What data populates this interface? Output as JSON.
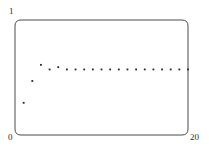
{
  "chart_data": {
    "type": "scatter",
    "title": "",
    "subtitle": "",
    "xlabel": "",
    "ylabel": "",
    "xlim": [
      0,
      20
    ],
    "ylim": [
      0,
      1
    ],
    "grid": false,
    "legend": null,
    "x_tick_labels": [
      "0",
      "20"
    ],
    "y_tick_labels": [
      "0",
      "1"
    ],
    "marker": "square-dot",
    "marker_color": "#262626",
    "frame_color": "#4a4a4a",
    "x": [
      1,
      2,
      3,
      4,
      5,
      6,
      7,
      8,
      9,
      10,
      11,
      12,
      13,
      14,
      15,
      16,
      17,
      18,
      19,
      20
    ],
    "values": [
      0.28,
      0.47,
      0.61,
      0.57,
      0.59,
      0.57,
      0.57,
      0.57,
      0.57,
      0.57,
      0.57,
      0.57,
      0.57,
      0.57,
      0.57,
      0.57,
      0.57,
      0.57,
      0.57,
      0.57
    ],
    "series": [
      {
        "name": "series-1",
        "values": [
          0.28,
          0.47,
          0.61,
          0.57,
          0.59,
          0.57,
          0.57,
          0.57,
          0.57,
          0.57,
          0.57,
          0.57,
          0.57,
          0.57,
          0.57,
          0.57,
          0.57,
          0.57,
          0.57,
          0.57
        ]
      }
    ],
    "annotations": []
  },
  "axes": {
    "y_max_label": "1",
    "y_min_label": "0",
    "x_max_label": "20"
  }
}
